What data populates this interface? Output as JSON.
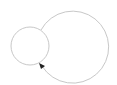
{
  "diagram": {
    "type": "graph-self-loop",
    "colors": {
      "background": "#ffffff",
      "stroke": "#c8c8c8",
      "arrow": "#222222"
    },
    "node": {
      "shape": "circle",
      "cx": 30,
      "cy": 46,
      "r": 19,
      "label": ""
    },
    "loop_edge": {
      "path": "M 41 30 A 36 36 0 1 1 42 66",
      "arrowhead": {
        "tip_x": 40,
        "tip_y": 64,
        "direction": "up-left"
      }
    }
  }
}
